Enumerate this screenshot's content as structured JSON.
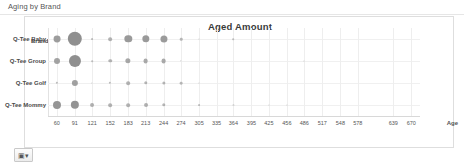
{
  "panel": {
    "header": "Aging by Brand"
  },
  "footer": {
    "control_icon": "table-settings-icon",
    "control_glyph": "▣▾"
  },
  "chart_data": {
    "type": "scatter",
    "title": "Aged Amount",
    "xlabel": "Age",
    "ylabel": "Brand",
    "grid": true,
    "legend": false,
    "bubble_color": "#8f8f8f",
    "categories": [
      "Q-Tee Baby",
      "Q-Tee Group",
      "Q-Tee Golf",
      "Q-Tee Mommy"
    ],
    "x": [
      60,
      91,
      121,
      152,
      183,
      213,
      244,
      274,
      305,
      335,
      364,
      395,
      425,
      456,
      486,
      517,
      548,
      578,
      639,
      670
    ],
    "xlim": [
      45,
      685
    ],
    "series": [
      {
        "name": "Q-Tee Baby",
        "points": [
          {
            "x": 60,
            "size": 6.0
          },
          {
            "x": 91,
            "size": 12.5
          },
          {
            "x": 121,
            "size": 1.6
          },
          {
            "x": 152,
            "size": 3.2
          },
          {
            "x": 183,
            "size": 6.4
          },
          {
            "x": 213,
            "size": 6.4
          },
          {
            "x": 244,
            "size": 6.2
          },
          {
            "x": 274,
            "size": 2.2
          },
          {
            "x": 305,
            "size": 0.9
          },
          {
            "x": 364,
            "size": 1.4
          }
        ]
      },
      {
        "name": "Q-Tee Group",
        "points": [
          {
            "x": 60,
            "size": 5.2
          },
          {
            "x": 91,
            "size": 10.5
          },
          {
            "x": 121,
            "size": 1.4
          },
          {
            "x": 152,
            "size": 3.0
          },
          {
            "x": 183,
            "size": 4.6
          },
          {
            "x": 213,
            "size": 4.2
          },
          {
            "x": 244,
            "size": 4.2
          },
          {
            "x": 274,
            "size": 1.2
          },
          {
            "x": 486,
            "size": 1.0
          }
        ]
      },
      {
        "name": "Q-Tee Golf",
        "points": [
          {
            "x": 60,
            "size": 2.0
          },
          {
            "x": 91,
            "size": 5.4
          },
          {
            "x": 121,
            "size": 1.1
          },
          {
            "x": 152,
            "size": 2.0
          },
          {
            "x": 183,
            "size": 3.2
          },
          {
            "x": 213,
            "size": 3.0
          },
          {
            "x": 244,
            "size": 2.8
          },
          {
            "x": 274,
            "size": 2.4
          },
          {
            "x": 305,
            "size": 0.9
          }
        ]
      },
      {
        "name": "Q-Tee Mommy",
        "points": [
          {
            "x": 60,
            "size": 7.0
          },
          {
            "x": 91,
            "size": 7.2
          },
          {
            "x": 121,
            "size": 3.4
          },
          {
            "x": 152,
            "size": 3.2
          },
          {
            "x": 183,
            "size": 3.2
          },
          {
            "x": 213,
            "size": 3.4
          },
          {
            "x": 244,
            "size": 3.0
          },
          {
            "x": 305,
            "size": 1.6
          },
          {
            "x": 364,
            "size": 1.0
          },
          {
            "x": 425,
            "size": 1.0
          },
          {
            "x": 456,
            "size": 1.0
          }
        ]
      }
    ]
  }
}
